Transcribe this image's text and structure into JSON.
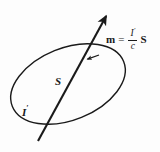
{
  "figure": {
    "background_color": "#fdfdfd",
    "ink_color": "#1a1a1a",
    "labels": {
      "area_vector": "S",
      "current": "I",
      "current_prime": "′"
    },
    "equation": {
      "lhs": "m",
      "relation": "=",
      "numerator": "I",
      "numerator_prime": "′",
      "denominator": "c",
      "rhs": "S",
      "plain_text": "m = (I′/c) S"
    },
    "geometry": {
      "loop": {
        "shape": "ellipse",
        "center_x": 68,
        "center_y": 84,
        "radius_x": 60,
        "radius_y": 36,
        "rotation_deg": -22,
        "stroke_width": 1.4,
        "direction": "counterclockwise"
      },
      "axis_arrow": {
        "x1": 38,
        "y1": 141,
        "x2": 108,
        "y2": 13,
        "stroke_width": 2.1,
        "arrowhead": "at-top"
      },
      "loop_arrowhead": {
        "x": 88,
        "y": 59,
        "points_toward": "upper-left"
      }
    }
  }
}
